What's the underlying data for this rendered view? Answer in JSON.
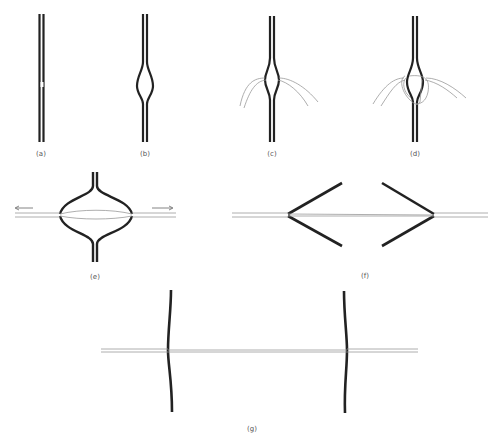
{
  "figure": {
    "panels": [
      {
        "id": "a",
        "label": "(a)",
        "marker": "P"
      },
      {
        "id": "b",
        "label": "(b)"
      },
      {
        "id": "c",
        "label": "(c)"
      },
      {
        "id": "d",
        "label": "(d)"
      },
      {
        "id": "e",
        "label": "(e)"
      },
      {
        "id": "f",
        "label": "(f)"
      },
      {
        "id": "g",
        "label": "(g)"
      }
    ]
  },
  "colors": {
    "background": "#ffffff",
    "strand": "#222222",
    "thin_strand": "#999999",
    "label": "#555555"
  }
}
